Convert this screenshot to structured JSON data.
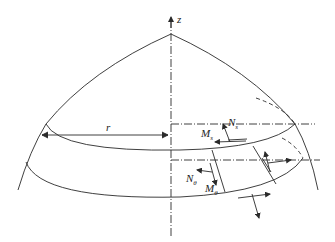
{
  "diagram": {
    "labels": {
      "axis_z": "z",
      "radius": "r",
      "Ns": {
        "main": "N",
        "sub": "s"
      },
      "Ms": {
        "main": "M",
        "sub": "s"
      },
      "Ntheta": {
        "main": "N",
        "sub": "θ"
      },
      "Mtheta": {
        "main": "M",
        "sub": "θ"
      }
    },
    "colors": {
      "stroke": "#2a2a2a",
      "background": "#ffffff"
    }
  }
}
